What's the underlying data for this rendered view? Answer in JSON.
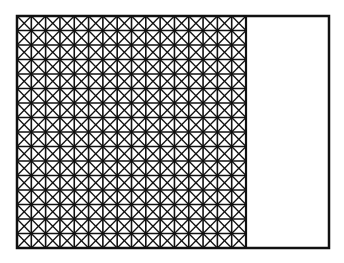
{
  "diagram": {
    "outer_rect": {
      "x": 17,
      "y": 16,
      "width": 312,
      "height": 232
    },
    "hatched_region": {
      "x": 17,
      "y": 16,
      "width": 229,
      "height": 232,
      "cols": 16,
      "rows": 16
    },
    "stroke_color": "#111111",
    "fill_color": "#ffffff"
  }
}
